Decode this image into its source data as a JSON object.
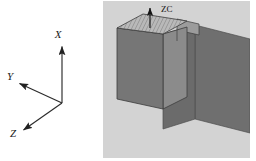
{
  "figure": {
    "background_color": "#ffffff",
    "width": 256,
    "height": 161
  },
  "axes_panel": {
    "name": "coordinate-axis-triad",
    "origin": {
      "x": 62,
      "y": 103
    },
    "axes": [
      {
        "id": "x-axis",
        "label": "X",
        "direction": "up",
        "tip": {
          "x": 62,
          "y": 45
        },
        "label_pos": {
          "x": 58,
          "y": 38
        }
      },
      {
        "id": "y-axis",
        "label": "Y",
        "direction": "upper-left",
        "tip": {
          "x": 18,
          "y": 83
        },
        "label_pos": {
          "x": 6,
          "y": 80
        }
      },
      {
        "id": "z-axis",
        "label": "Z",
        "direction": "lower-left",
        "tip": {
          "x": 22,
          "y": 131
        },
        "label_pos": {
          "x": 9,
          "y": 137
        }
      }
    ],
    "line_color": "#2b2b2b",
    "label_color": "#1a1a1a"
  },
  "model_panel": {
    "name": "isometric-model-viewport",
    "background_color": "#d3d3d3",
    "annotation": {
      "label": "ZC",
      "label_pos": {
        "x": 46,
        "y": 14
      },
      "arrow_from": {
        "x": 35,
        "y": 27
      },
      "arrow_to": {
        "x": 35,
        "y": 7
      },
      "arrow_color": "#141414"
    },
    "solids": [
      {
        "id": "block",
        "name": "rectangular-block",
        "top_face_color": "#b4b4b4",
        "top_face_hatched": true,
        "hatch_color": "#6e6e6e",
        "front_face_color": "#777777",
        "side_face_color": "#8a8a8a",
        "edge_color": "#3c3c3c"
      },
      {
        "id": "plate",
        "name": "flat-plane-quadrilateral",
        "face_color": "#6f6f6f",
        "edge_color": "#4a4a4a"
      },
      {
        "id": "tab",
        "name": "small-tab-face",
        "face_color": "#9a9a9a",
        "edge_color": "#3c3c3c"
      }
    ]
  }
}
